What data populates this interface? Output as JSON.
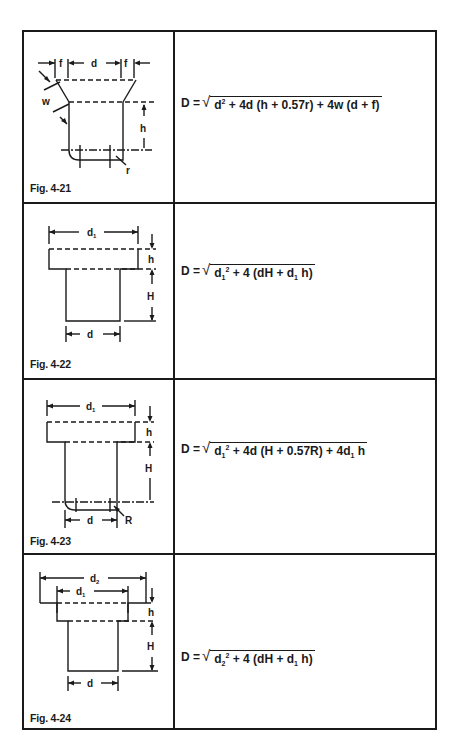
{
  "table": {
    "rows": [
      {
        "figure_label": "Fig. 4-21",
        "dimension_labels": [
          "f",
          "d",
          "f",
          "w",
          "h",
          "r"
        ],
        "formula": {
          "lhs": "D =",
          "radicand_parts": [
            "d",
            "2",
            " + 4d (h + 0.57r) + 4w (d + f)"
          ],
          "full_text": "D = √(d² + 4d (h + 0.57r) + 4w (d + f))"
        }
      },
      {
        "figure_label": "Fig. 4-22",
        "dimension_labels": [
          "d1",
          "h",
          "H",
          "d"
        ],
        "formula": {
          "lhs": "D =",
          "radicand_parts": [
            "d",
            "1",
            "2",
            " + 4 (dH + d",
            "1",
            " h)"
          ],
          "full_text": "D = √(d₁² + 4 (dH + d₁ h))"
        }
      },
      {
        "figure_label": "Fig. 4-23",
        "dimension_labels": [
          "d1",
          "h",
          "H",
          "d",
          "R"
        ],
        "formula": {
          "lhs": "D =",
          "radicand_parts": [
            "d",
            "1",
            "2",
            " + 4d (H + 0.57R) + 4d",
            "1",
            " h"
          ],
          "full_text": "D = √(d₁² + 4d (H + 0.57R) + 4d₁ h)"
        }
      },
      {
        "figure_label": "Fig. 4-24",
        "dimension_labels": [
          "d2",
          "d1",
          "h",
          "H",
          "d"
        ],
        "formula": {
          "lhs": "D =",
          "radicand_parts": [
            "d",
            "2",
            "2",
            " + 4 (dH + d",
            "1",
            " h)"
          ],
          "full_text": "D = √(d₂² + 4 (dH + d₁ h))"
        }
      }
    ]
  }
}
